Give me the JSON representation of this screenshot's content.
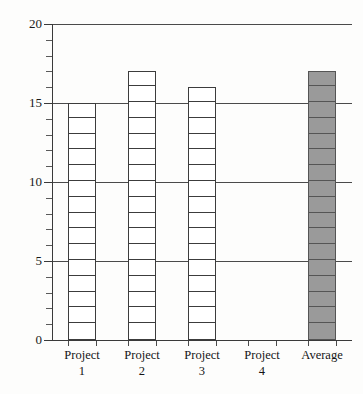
{
  "chart_data": {
    "type": "bar",
    "title": "",
    "subtitle": "",
    "xlabel": "",
    "ylabel": "",
    "categories": [
      "Project 1",
      "Project 2",
      "Project 3",
      "Project 4",
      "Average"
    ],
    "category_lines": [
      [
        "Project",
        "1"
      ],
      [
        "Project",
        "2"
      ],
      [
        "Project",
        "3"
      ],
      [
        "Project",
        "4"
      ],
      [
        "Average",
        ""
      ]
    ],
    "values": [
      15,
      17,
      16,
      0,
      17
    ],
    "ylim": [
      0,
      20
    ],
    "y_major_ticks": [
      0,
      5,
      10,
      15,
      20
    ],
    "y_major_tick_labels": [
      "0",
      "5",
      "10",
      "15",
      "20"
    ],
    "y_minor_tick_step": 1,
    "grid": true,
    "grid_axis": "y",
    "grid_values": [
      5,
      10,
      15,
      20
    ],
    "legend": false,
    "legend_position": "none",
    "bar_styles": [
      {
        "name": "Project 1",
        "fill": "#ffffff",
        "stroke": "#3c3c3c",
        "segmented": true
      },
      {
        "name": "Project 2",
        "fill": "#ffffff",
        "stroke": "#3c3c3c",
        "segmented": true
      },
      {
        "name": "Project 3",
        "fill": "#ffffff",
        "stroke": "#3c3c3c",
        "segmented": true
      },
      {
        "name": "Project 4",
        "fill": "none",
        "stroke": "none",
        "segmented": false
      },
      {
        "name": "Average",
        "fill": "#9a9a9a",
        "stroke": "#555555",
        "segmented": true
      }
    ],
    "colors": {
      "background": "#fdfdfc",
      "axis": "#3a3a3a",
      "gridline": "#4a4a4a",
      "bar_outline": "#3c3c3c",
      "average_fill": "#9a9a9a",
      "text": "#141414"
    }
  }
}
